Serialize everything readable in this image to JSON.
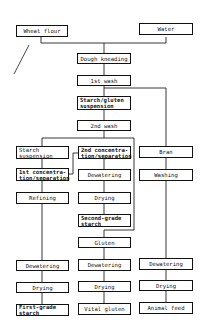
{
  "diagram": {
    "type": "process-flowchart",
    "inputs": {
      "wheat_flour": "Wheat flour",
      "water": "Water"
    },
    "main": {
      "dough_kneading": "Dough kneading",
      "first_wash": "1st wash",
      "starch_gluten": "Starch/gluten\nsuspension",
      "second_wash": "2nd wash"
    },
    "starch_branch": {
      "starch_suspension": "Starch\nsuspension",
      "first_concentration": "1st concentra-\ntion/separation",
      "refining": "Refining",
      "dewatering": "Dewatering",
      "drying": "Drying",
      "product": "First-grade\nstarch"
    },
    "second_branch": {
      "second_concentration": "2nd concentra-\ntion/separation",
      "dewatering": "Dewatering",
      "drying": "Drying",
      "product": "Second-grade\nstarch"
    },
    "gluten_branch": {
      "gluten": "Gluten",
      "dewatering": "Dewatering",
      "drying": "Drying",
      "product": "Vital gluten"
    },
    "bran_branch": {
      "bran": "Bran",
      "washing": "Washing",
      "dewatering": "Dewatering",
      "drying": "Drying",
      "product": "Animal feed"
    }
  }
}
